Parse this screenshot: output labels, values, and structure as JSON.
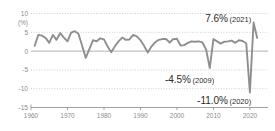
{
  "chart_data": {
    "type": "line",
    "title": "",
    "subtitle": "",
    "xlabel": "",
    "ylabel": "(%)",
    "unit": "(%)",
    "xlim": [
      1958,
      2023
    ],
    "ylim": [
      -15,
      10
    ],
    "yticks": [
      10,
      5,
      0,
      -5,
      -10,
      -15
    ],
    "ytick_labels": [
      "10",
      "5",
      "0",
      "-5",
      "-10",
      "-15"
    ],
    "xticks": [
      1960,
      1970,
      1980,
      1990,
      2000,
      2010,
      2020
    ],
    "xtick_labels": [
      "1960",
      "1970",
      "1980",
      "1990",
      "2000",
      "2010",
      "2020"
    ],
    "grid": true,
    "legend": "none",
    "line_color": "#8f8f8f",
    "series": [
      {
        "name": "growth-rate",
        "x": [
          1961,
          1962,
          1963,
          1964,
          1965,
          1966,
          1967,
          1968,
          1969,
          1970,
          1971,
          1972,
          1973,
          1974,
          1975,
          1976,
          1977,
          1978,
          1979,
          1980,
          1981,
          1982,
          1983,
          1984,
          1985,
          1986,
          1987,
          1988,
          1989,
          1990,
          1991,
          1992,
          1993,
          1994,
          1995,
          1996,
          1997,
          1998,
          1999,
          2000,
          2001,
          2002,
          2003,
          2004,
          2005,
          2006,
          2007,
          2008,
          2009,
          2010,
          2011,
          2012,
          2013,
          2014,
          2015,
          2016,
          2017,
          2018,
          2019,
          2020,
          2021,
          2022
        ],
        "values": [
          1.4,
          4.3,
          4.1,
          3.5,
          2.2,
          4.3,
          3.0,
          4.8,
          3.6,
          2.6,
          4.9,
          5.3,
          4.6,
          1.5,
          -1.8,
          0.5,
          2.9,
          2.6,
          3.4,
          3.1,
          1.2,
          -0.3,
          1.3,
          2.6,
          3.6,
          3.0,
          3.1,
          4.3,
          3.9,
          2.9,
          1.4,
          -0.4,
          1.2,
          2.3,
          3.0,
          3.2,
          3.2,
          2.3,
          3.2,
          3.3,
          1.5,
          1.6,
          2.2,
          2.6,
          2.5,
          2.6,
          2.3,
          0.4,
          -4.5,
          3.2,
          2.6,
          2.0,
          2.5,
          2.6,
          2.8,
          2.2,
          2.9,
          2.7,
          2.1,
          -11.0,
          7.6,
          3.5
        ],
        "color": "#8f8f8f"
      }
    ],
    "annotations": [
      {
        "id": "peak-2021",
        "value_text": "7.6%",
        "year_text": "(2021)",
        "x": 2021,
        "y": 7.6
      },
      {
        "id": "trough-2009",
        "value_text": "-4.5%",
        "year_text": "(2009)",
        "x": 2009,
        "y": -4.5
      },
      {
        "id": "trough-2020",
        "value_text": "-11.0%",
        "year_text": "(2020)",
        "x": 2020,
        "y": -11.0
      }
    ]
  }
}
